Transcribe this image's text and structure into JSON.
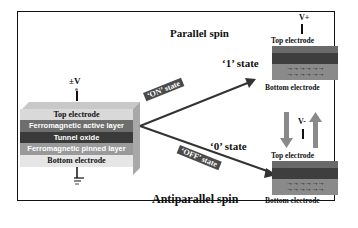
{
  "diagram": {
    "left_device": {
      "voltage_label": "±V",
      "layers": [
        {
          "name": "top-electrode",
          "label": "Top electrode",
          "color": "#d9d9d9",
          "text_color": "#111111"
        },
        {
          "name": "ferromagnetic-active-layer",
          "label": "Ferromagnetic active layer",
          "color": "#6e6e6e",
          "text_color": "#ffffff"
        },
        {
          "name": "tunnel-oxide",
          "label": "Tunnel oxide",
          "color": "#3a3a3a",
          "text_color": "#ffffff"
        },
        {
          "name": "ferromagnetic-pinned-layer",
          "label": "Ferromagnetic pinned layer",
          "color": "#9a9a9a",
          "text_color": "#ffffff"
        },
        {
          "name": "bottom-electrode",
          "label": "Bottom electrode",
          "color": "#e6e6e6",
          "text_color": "#111111"
        }
      ],
      "ground_symbol": "ground"
    },
    "on_branch": {
      "tag": "‘ON’ state",
      "state_label": "‘1’ state",
      "spin_label": "Parallel spin"
    },
    "off_branch": {
      "tag": "‘OFF’ state",
      "state_label": "‘0’ state",
      "spin_label": "Antiparallel spin"
    },
    "top_cell": {
      "voltage_label": "V+",
      "top_label": "Top electrode",
      "bottom_label": "Bottom electrode"
    },
    "bottom_cell": {
      "voltage_label": "V-",
      "top_label": "Top electrode",
      "bottom_label": "Bottom electrode"
    },
    "colors": {
      "frame": "#111111",
      "arrow": "#3a3a3a",
      "switch_arrow": "#8a8a8a"
    }
  }
}
